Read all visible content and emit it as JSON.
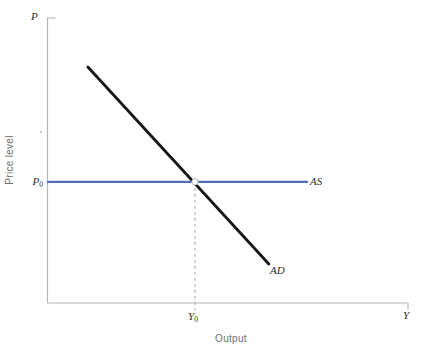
{
  "figure": {
    "labels": {
      "y_axis_top": "P",
      "y_axis_title": "Price level",
      "x_axis_title": "Output",
      "x_axis_end": "Y",
      "p0": {
        "base": "P",
        "sub": "0"
      },
      "y0": {
        "base": "Y",
        "sub": "0"
      },
      "as_curve": "AS",
      "ad_curve": "AD"
    }
  },
  "chart_data": {
    "type": "line",
    "title": "",
    "xlabel": "Output",
    "ylabel": "Price level",
    "x_axis_end_label": "Y",
    "y_axis_end_label": "P",
    "x_tick_labels": [
      "Y0"
    ],
    "y_tick_labels": [
      "P0"
    ],
    "axes_numeric_scale": false,
    "axis_color": "#b5b5b5",
    "grid": false,
    "legend": "none",
    "series": [
      {
        "name": "AS",
        "description": "horizontal aggregate supply line at price level P0",
        "color": "#4f6db8",
        "width_px": 2.3,
        "points": [
          [
            0.001,
            0.425
          ],
          [
            0.72,
            0.425
          ]
        ]
      },
      {
        "name": "AD",
        "description": "downward-sloping aggregate demand line",
        "color": "#161616",
        "width_px": 2.8,
        "points": [
          [
            0.112,
            0.828
          ],
          [
            0.614,
            0.137
          ]
        ]
      }
    ],
    "guides": [
      {
        "type": "dashed_vertical",
        "x": 0.409,
        "y_from": 0.425,
        "y_to": -0.025,
        "color": "#a8a8a8",
        "width_px": 1,
        "dash": [
          3,
          3
        ]
      }
    ],
    "markers": [
      {
        "type": "open_circle",
        "description": "equilibrium point at (Y0, P0)",
        "x": 0.409,
        "y": 0.425,
        "radius_px": 3.2,
        "fill": "#ffffff",
        "stroke": "#a9b4a9",
        "stroke_width_px": 1
      }
    ]
  }
}
